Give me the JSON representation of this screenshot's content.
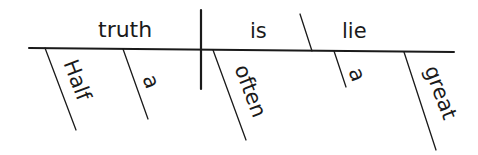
{
  "diagram": {
    "type": "sentence-diagram",
    "sentence": "Half a truth is often a great lie",
    "subject": "truth",
    "verb": "is",
    "predicate_nominative": "lie",
    "subject_modifiers": [
      "Half",
      "a"
    ],
    "verb_modifiers": [
      "often"
    ],
    "predicate_modifiers": [
      "a",
      "great"
    ],
    "line_color": "#1a1a1a"
  }
}
